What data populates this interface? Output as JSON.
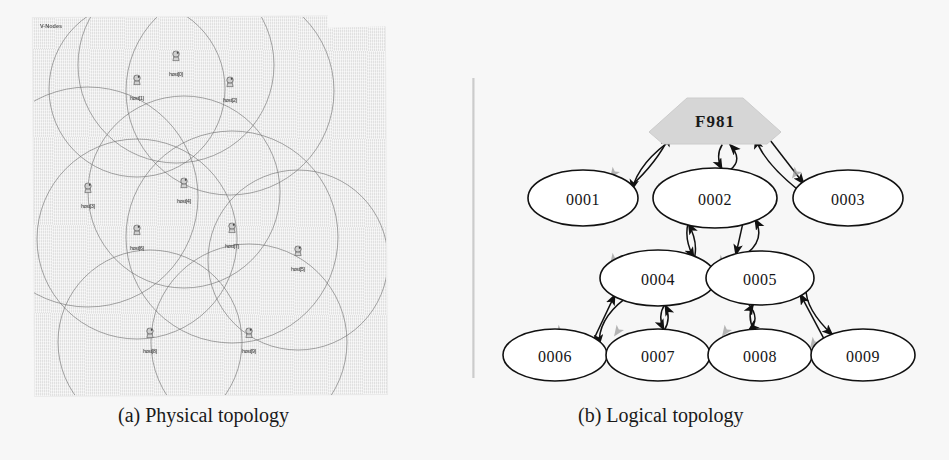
{
  "figure": {
    "panels": [
      {
        "id": "physical",
        "caption": "(a) Physical topology",
        "window_label": "V-Nodes",
        "node_label_prefix": "host",
        "hosts": [
          {
            "label": "host[0]",
            "x": 142,
            "y": 48,
            "r": 98
          },
          {
            "label": "host[1]",
            "x": 103,
            "y": 72,
            "r": 88
          },
          {
            "label": "host[2]",
            "x": 196,
            "y": 74,
            "r": 104
          },
          {
            "label": "host[3]",
            "x": 54,
            "y": 180,
            "r": 110
          },
          {
            "label": "host[4]",
            "x": 150,
            "y": 175,
            "r": 96
          },
          {
            "label": "host[5]",
            "x": 264,
            "y": 243,
            "r": 90
          },
          {
            "label": "host[6]",
            "x": 103,
            "y": 222,
            "r": 100
          },
          {
            "label": "host[7]",
            "x": 198,
            "y": 220,
            "r": 106
          },
          {
            "label": "host[8]",
            "x": 116,
            "y": 325,
            "r": 92
          },
          {
            "label": "host[9]",
            "x": 215,
            "y": 325,
            "r": 98
          }
        ]
      },
      {
        "id": "logical",
        "caption": "(b) Logical topology",
        "root": {
          "label": "F981",
          "shape": "pentagon",
          "fill": "#d6d6d6"
        },
        "nodes": [
          {
            "label": "0001",
            "x": 113,
            "y": 118,
            "rx": 55,
            "ry": 28
          },
          {
            "label": "0002",
            "x": 245,
            "y": 118,
            "rx": 62,
            "ry": 30
          },
          {
            "label": "0003",
            "x": 378,
            "y": 118,
            "rx": 55,
            "ry": 28
          },
          {
            "label": "0004",
            "x": 188,
            "y": 198,
            "rx": 58,
            "ry": 28
          },
          {
            "label": "0005",
            "x": 290,
            "y": 198,
            "rx": 54,
            "ry": 27
          },
          {
            "label": "0006",
            "x": 85,
            "y": 275,
            "rx": 52,
            "ry": 26
          },
          {
            "label": "0007",
            "x": 188,
            "y": 275,
            "rx": 52,
            "ry": 26
          },
          {
            "label": "0008",
            "x": 290,
            "y": 275,
            "rx": 52,
            "ry": 26
          },
          {
            "label": "0009",
            "x": 393,
            "y": 275,
            "rx": 52,
            "ry": 26
          }
        ],
        "edges": [
          {
            "from": "F981",
            "to": "0001"
          },
          {
            "from": "F981",
            "to": "0002"
          },
          {
            "from": "F981",
            "to": "0003"
          },
          {
            "from": "0001",
            "to": "F981"
          },
          {
            "from": "0002",
            "to": "F981"
          },
          {
            "from": "0003",
            "to": "F981"
          },
          {
            "from": "0002",
            "to": "0004"
          },
          {
            "from": "0002",
            "to": "0005"
          },
          {
            "from": "0004",
            "to": "0002"
          },
          {
            "from": "0005",
            "to": "0002"
          },
          {
            "from": "0004",
            "to": "0006"
          },
          {
            "from": "0004",
            "to": "0007"
          },
          {
            "from": "0006",
            "to": "0004"
          },
          {
            "from": "0007",
            "to": "0004"
          },
          {
            "from": "0005",
            "to": "0008"
          },
          {
            "from": "0005",
            "to": "0009"
          },
          {
            "from": "0008",
            "to": "0005"
          },
          {
            "from": "0009",
            "to": "0005"
          }
        ],
        "arrow_colors": {
          "primary": "#111111",
          "secondary": "#9e9e9e"
        }
      }
    ]
  },
  "colors": {
    "page_background": "#f7f7f7",
    "scan_paper": "#e9e9e9",
    "ink": "#1a1a1a",
    "root_fill": "#d6d6d6",
    "grey_arrow": "#9e9e9e"
  }
}
